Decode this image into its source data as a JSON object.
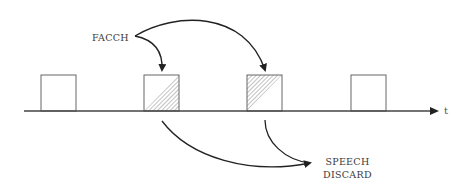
{
  "diagram": {
    "type": "timing-diagram",
    "labels": {
      "facch": "FACCH",
      "speech_line1": "SPEECH",
      "speech_line2": "DISCARD",
      "time_axis": "t"
    },
    "colors": {
      "stroke": "#222222",
      "box_stroke": "#666666",
      "hatch": "#777777",
      "background": "#ffffff"
    },
    "timeline": {
      "x_start": 24,
      "x_end": 436,
      "y": 111
    },
    "slots": [
      {
        "index": 1,
        "x": 41,
        "width": 35,
        "hatched": "none"
      },
      {
        "index": 2,
        "x": 144,
        "width": 35,
        "hatched": "lower-right-triangle"
      },
      {
        "index": 3,
        "x": 247,
        "width": 35,
        "hatched": "upper-left-triangle"
      },
      {
        "index": 4,
        "x": 351,
        "width": 35,
        "hatched": "none"
      }
    ],
    "arrows": [
      {
        "from": "FACCH",
        "to": "slot-2",
        "description": "FACCH stealing into slot 2"
      },
      {
        "from": "FACCH",
        "to": "slot-3",
        "description": "FACCH stealing into slot 3"
      },
      {
        "from": "slot-2",
        "to": "SPEECH DISCARD",
        "description": "speech in slot 2 discarded"
      },
      {
        "from": "slot-3",
        "to": "SPEECH DISCARD",
        "description": "speech in slot 3 discarded"
      }
    ]
  }
}
